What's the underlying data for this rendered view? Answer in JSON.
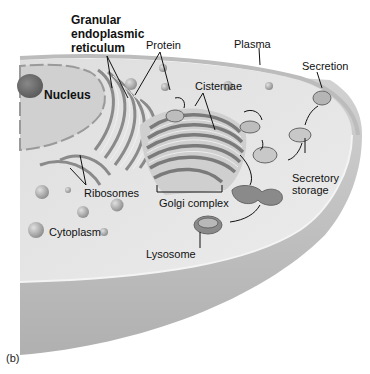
{
  "figure": {
    "panel_label": "(b)",
    "labels": {
      "granular_er": [
        "Granular",
        "endoplasmic",
        "reticulum"
      ],
      "protein": "Protein",
      "plasma": "Plasma",
      "secretion": "Secretion",
      "nucleus": "Nucleus",
      "cisternae": "Cisternae",
      "ribosomes": "Ribosomes",
      "golgi_complex": "Golgi complex",
      "secretory_storage": [
        "Secretory",
        "storage"
      ],
      "cytoplasm": "Cytoplasm",
      "lysosome": "Lysosome"
    },
    "colors": {
      "background": "#ffffff",
      "cell_top": "#e4e4e4",
      "cell_side": "#c8c8c8",
      "organelle_dark": "#7a7a7a",
      "organelle_light": "#d8d8d8",
      "text": "#111111"
    }
  }
}
